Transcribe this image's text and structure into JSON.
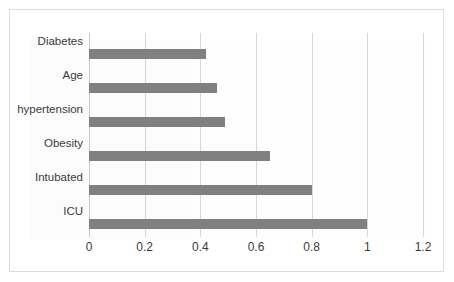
{
  "chart_data": {
    "type": "bar",
    "orientation": "horizontal",
    "title": "",
    "subtitle": "",
    "xlabel": "",
    "ylabel": "",
    "categories": [
      "Diabetes",
      "Age",
      "hypertension",
      "Obesity",
      "Intubated",
      "ICU"
    ],
    "values": [
      0.42,
      0.46,
      0.49,
      0.65,
      0.8,
      1.0
    ],
    "series": [
      {
        "name": "",
        "values": [
          0.42,
          0.46,
          0.49,
          0.65,
          0.8,
          1.0
        ]
      }
    ],
    "xlim": [
      0,
      1.2
    ],
    "xticks": [
      0,
      0.2,
      0.4,
      0.6,
      0.8,
      1,
      1.2
    ],
    "xtick_labels": [
      "0",
      "0.2",
      "0.4",
      "0.6",
      "0.8",
      "1",
      "1.2"
    ],
    "grid": "vertical",
    "legend": "none",
    "bar_color": "#808080",
    "gridline_color": "#d6d6d6",
    "border_color": "#dcdcdc",
    "plot_background": "#ffffff",
    "text_color": "#3b3b3b"
  }
}
